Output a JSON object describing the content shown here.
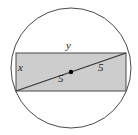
{
  "figure": {
    "colors": {
      "rectangle_fill": "#cdcdcd",
      "stroke": "#4a4a4a",
      "diagonal_stroke": "#333333",
      "center_dot": "#000000",
      "background": "#ffffff",
      "text": "#1a1a1a"
    },
    "circle": {
      "cx": 71,
      "cy": 68,
      "r": 60,
      "stroke_width": 1
    },
    "rectangle": {
      "x": 16,
      "y": 53,
      "width": 110,
      "height": 38,
      "stroke_width": 1
    },
    "diagonal": {
      "x1": 16,
      "y1": 91,
      "x2": 126,
      "y2": 53,
      "stroke_width": 1.2
    },
    "center_point": {
      "cx": 71,
      "cy": 72,
      "r": 2.2
    },
    "labels": {
      "top_side": "y",
      "left_side": "x",
      "diagonal_left_half": "5",
      "diagonal_right_half": "5"
    }
  }
}
